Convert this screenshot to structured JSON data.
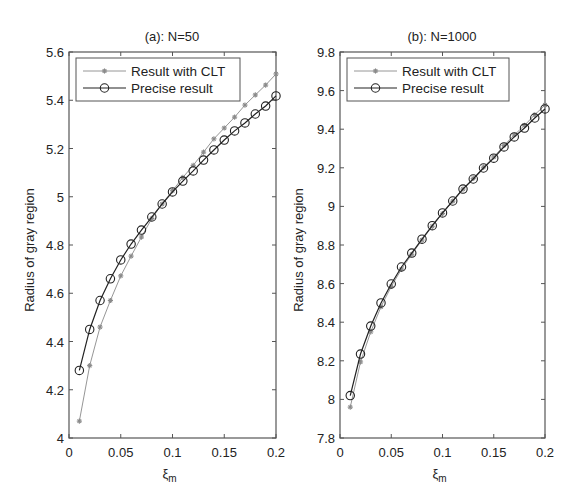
{
  "chart_data": [
    {
      "type": "line",
      "title": "(a): N=50",
      "xlabel": "ξ_m",
      "xlabel_main": "ξ",
      "xlabel_sub": "m",
      "ylabel": "Radius of gray region",
      "xlim": [
        0,
        0.2
      ],
      "ylim": [
        4.0,
        5.6
      ],
      "xticks": [
        0,
        0.05,
        0.1,
        0.15,
        0.2
      ],
      "xtick_labels": [
        "0",
        "0.05",
        "0.1",
        "0.15",
        "0.2"
      ],
      "yticks": [
        4.0,
        4.2,
        4.4,
        4.6,
        4.8,
        5.0,
        5.2,
        5.4,
        5.6
      ],
      "ytick_labels": [
        "4",
        "4.2",
        "4.4",
        "4.6",
        "4.8",
        "5",
        "5.2",
        "5.4",
        "5.6"
      ],
      "grid": false,
      "legend_position": "upper left",
      "x": [
        0.01,
        0.02,
        0.03,
        0.04,
        0.05,
        0.06,
        0.07,
        0.08,
        0.09,
        0.1,
        0.11,
        0.12,
        0.13,
        0.14,
        0.15,
        0.16,
        0.17,
        0.18,
        0.19,
        0.2
      ],
      "series": [
        {
          "name": "Result with CLT",
          "marker": "star",
          "color": "#8a8a8a",
          "values": [
            4.07,
            4.3,
            4.46,
            4.57,
            4.672,
            4.754,
            4.833,
            4.91,
            4.97,
            5.025,
            5.08,
            5.13,
            5.185,
            5.24,
            5.285,
            5.33,
            5.38,
            5.422,
            5.463,
            5.509
          ]
        },
        {
          "name": "Precise result",
          "marker": "circle",
          "color": "#222222",
          "values": [
            4.28,
            4.45,
            4.57,
            4.66,
            4.738,
            4.804,
            4.862,
            4.916,
            4.97,
            5.02,
            5.065,
            5.107,
            5.152,
            5.194,
            5.235,
            5.273,
            5.306,
            5.343,
            5.376,
            5.418
          ]
        }
      ]
    },
    {
      "type": "line",
      "title": "(b): N=1000",
      "xlabel": "ξ_m",
      "xlabel_main": "ξ",
      "xlabel_sub": "m",
      "ylabel": "Radius of gray region",
      "xlim": [
        0,
        0.2
      ],
      "ylim": [
        7.8,
        9.8
      ],
      "xticks": [
        0,
        0.05,
        0.1,
        0.15,
        0.2
      ],
      "xtick_labels": [
        "0",
        "0.05",
        "0.1",
        "0.15",
        "0.2"
      ],
      "yticks": [
        7.8,
        8.0,
        8.2,
        8.4,
        8.6,
        8.8,
        9.0,
        9.2,
        9.4,
        9.6,
        9.8
      ],
      "ytick_labels": [
        "7.8",
        "8",
        "8.2",
        "8.4",
        "8.6",
        "8.8",
        "9",
        "9.2",
        "9.4",
        "9.6",
        "9.8"
      ],
      "grid": false,
      "legend_position": "upper left",
      "x": [
        0.01,
        0.02,
        0.03,
        0.04,
        0.05,
        0.06,
        0.07,
        0.08,
        0.09,
        0.1,
        0.11,
        0.12,
        0.13,
        0.14,
        0.15,
        0.16,
        0.17,
        0.18,
        0.19,
        0.2
      ],
      "series": [
        {
          "name": "Result with CLT",
          "marker": "star",
          "color": "#8a8a8a",
          "values": [
            7.96,
            8.194,
            8.35,
            8.48,
            8.585,
            8.675,
            8.752,
            8.826,
            8.897,
            8.963,
            9.027,
            9.09,
            9.145,
            9.203,
            9.256,
            9.316,
            9.37,
            9.42,
            9.475,
            9.525
          ]
        },
        {
          "name": "Precise result",
          "marker": "circle",
          "color": "#222222",
          "values": [
            8.02,
            8.235,
            8.38,
            8.5,
            8.598,
            8.686,
            8.758,
            8.83,
            8.9,
            8.966,
            9.028,
            9.09,
            9.142,
            9.199,
            9.25,
            9.308,
            9.36,
            9.406,
            9.458,
            9.505
          ]
        }
      ]
    }
  ],
  "layout": {
    "panels": [
      {
        "left": 69,
        "top": 52,
        "right": 276,
        "bottom": 438,
        "legend": {
          "x": 76,
          "y": 58,
          "w": 164,
          "h": 43
        },
        "title_x": 172,
        "ylabel_x": 34
      },
      {
        "left": 340,
        "top": 52,
        "right": 545,
        "bottom": 438,
        "legend": {
          "x": 347,
          "y": 58,
          "w": 162,
          "h": 43
        },
        "title_x": 442,
        "ylabel_x": 303
      }
    ]
  }
}
